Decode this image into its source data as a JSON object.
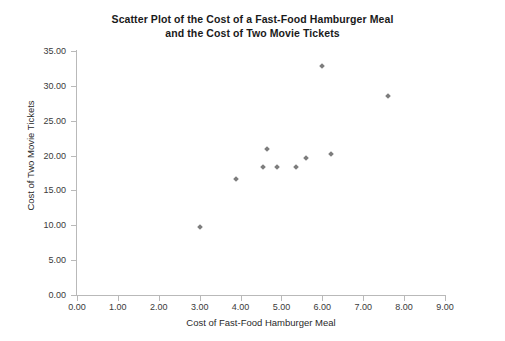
{
  "chart_data": {
    "type": "scatter",
    "title": "Scatter Plot of the Cost of a Fast-Food Hamburger Meal and the Cost of Two Movie Tickets",
    "title_line1": "Scatter Plot of the Cost of a Fast-Food Hamburger Meal",
    "title_line2": "and the Cost of Two Movie Tickets",
    "xlabel": "Cost of Fast-Food Hamburger Meal",
    "ylabel": "Cost of Two Movie Tickets",
    "xlim": [
      0.0,
      9.0
    ],
    "ylim": [
      0.0,
      35.0
    ],
    "xticks": [
      0.0,
      1.0,
      2.0,
      3.0,
      4.0,
      5.0,
      6.0,
      7.0,
      8.0,
      9.0
    ],
    "yticks": [
      0.0,
      5.0,
      10.0,
      15.0,
      20.0,
      25.0,
      30.0,
      35.0
    ],
    "xtick_labels": [
      "0.00",
      "1.00",
      "2.00",
      "3.00",
      "4.00",
      "5.00",
      "6.00",
      "7.00",
      "8.00",
      "9.00"
    ],
    "ytick_labels": [
      "0.00",
      "5.00",
      "10.00",
      "15.00",
      "20.00",
      "25.00",
      "30.00",
      "35.00"
    ],
    "grid": false,
    "legend": false,
    "marker_color": "#7d7d7d",
    "marker_shape": "diamond",
    "axis_color": "#b9b9b9",
    "background_color": "#ffffff",
    "points": [
      {
        "x": 3.0,
        "y": 9.8
      },
      {
        "x": 3.9,
        "y": 16.6
      },
      {
        "x": 4.55,
        "y": 18.3
      },
      {
        "x": 4.65,
        "y": 21.0
      },
      {
        "x": 4.9,
        "y": 18.3
      },
      {
        "x": 5.35,
        "y": 18.3
      },
      {
        "x": 5.6,
        "y": 19.7
      },
      {
        "x": 6.0,
        "y": 32.8
      },
      {
        "x": 6.2,
        "y": 20.2
      },
      {
        "x": 7.6,
        "y": 28.5
      }
    ]
  }
}
